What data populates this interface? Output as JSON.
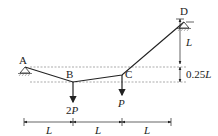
{
  "diagram": {
    "nodes": {
      "A": {
        "label": "A",
        "x": 25,
        "y": 67
      },
      "B": {
        "label": "B",
        "x": 73,
        "y": 82
      },
      "C": {
        "label": "C",
        "x": 122,
        "y": 75
      },
      "D": {
        "label": "D",
        "x": 184,
        "y": 22
      }
    },
    "loads": {
      "B": {
        "label": "2P"
      },
      "C": {
        "label": "P"
      }
    },
    "dimensions": {
      "vertical_top": "L",
      "vertical_bottom": "0.25L",
      "horizontal": [
        "L",
        "L",
        "L"
      ]
    },
    "colors": {
      "line": "#222222",
      "dashed": "#888888"
    }
  }
}
